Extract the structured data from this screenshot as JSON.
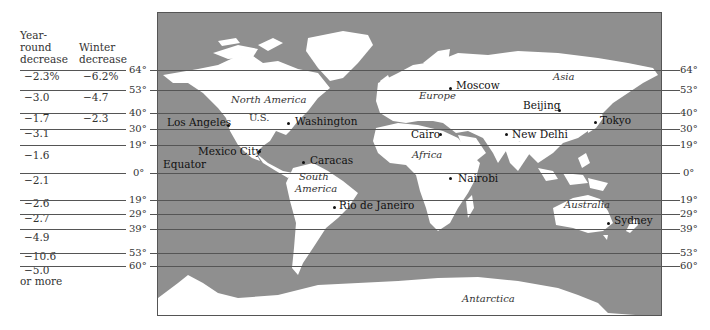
{
  "table": {
    "col1_header": [
      "Year-",
      "round",
      "decrease"
    ],
    "col2_header": [
      "Winter",
      "decrease"
    ],
    "rows": [
      {
        "year": "−2.3%",
        "winter": "−6.2%",
        "y": 76
      },
      {
        "year": "−3.0",
        "winter": "−4.7",
        "y": 97
      },
      {
        "year": "−1.7",
        "winter": "−2.3",
        "y": 118
      },
      {
        "year": "−3.1",
        "winter": "",
        "y": 133
      },
      {
        "year": "−1.6",
        "winter": "",
        "y": 155
      },
      {
        "year": "−2.1",
        "winter": "",
        "y": 180
      },
      {
        "year": "−2.6",
        "winter": "",
        "y": 203
      },
      {
        "year": "−2.7",
        "winter": "",
        "y": 218
      },
      {
        "year": "−4.9",
        "winter": "",
        "y": 237
      },
      {
        "year": "−10.6",
        "winter": "",
        "y": 256
      },
      {
        "year": "−5.0",
        "winter": "",
        "y": 270
      },
      {
        "year": "or more",
        "winter": "",
        "y": 281
      }
    ]
  },
  "latitudes": [
    {
      "label": "64°",
      "y": 70
    },
    {
      "label": "53°",
      "y": 90
    },
    {
      "label": "40°",
      "y": 113
    },
    {
      "label": "30°",
      "y": 129
    },
    {
      "label": "19°",
      "y": 145
    },
    {
      "label": "0°",
      "y": 173
    },
    {
      "label": "19°",
      "y": 200
    },
    {
      "label": "29°",
      "y": 214
    },
    {
      "label": "39°",
      "y": 229
    },
    {
      "label": "53°",
      "y": 253
    },
    {
      "label": "60°",
      "y": 266
    }
  ],
  "cities": [
    {
      "name": "Moscow",
      "dot": [
        449,
        87
      ],
      "label": [
        455,
        80
      ]
    },
    {
      "name": "Beijing",
      "dot": [
        558,
        109
      ],
      "label": [
        522,
        100
      ]
    },
    {
      "name": "Tokyo",
      "dot": [
        594,
        121
      ],
      "label": [
        599,
        115
      ]
    },
    {
      "name": "Los Angeles",
      "dot": [
        227,
        124
      ],
      "label": [
        166,
        117
      ]
    },
    {
      "name": "Washington",
      "dot": [
        287,
        122
      ],
      "label": [
        294,
        116
      ]
    },
    {
      "name": "Cairo",
      "dot": [
        439,
        133
      ],
      "label": [
        410,
        129
      ]
    },
    {
      "name": "New Delhi",
      "dot": [
        505,
        133
      ],
      "label": [
        511,
        129
      ]
    },
    {
      "name": "Mexico City",
      "dot": [
        258,
        150
      ],
      "label": [
        197,
        146
      ]
    },
    {
      "name": "Caracas",
      "dot": [
        302,
        161
      ],
      "label": [
        309,
        155
      ]
    },
    {
      "name": "Equator",
      "dot": null,
      "label": [
        162,
        159
      ]
    },
    {
      "name": "Nairobi",
      "dot": [
        449,
        177
      ],
      "label": [
        457,
        173
      ]
    },
    {
      "name": "Rio de Janeiro",
      "dot": [
        333,
        206
      ],
      "label": [
        338,
        200
      ]
    },
    {
      "name": "Sydney",
      "dot": [
        607,
        222
      ],
      "label": [
        613,
        215
      ]
    }
  ],
  "regions": [
    {
      "name": "North America",
      "pos": [
        230,
        99
      ]
    },
    {
      "name": "U.S.",
      "pos": [
        248,
        117
      ]
    },
    {
      "name": "Europe",
      "pos": [
        418,
        95
      ]
    },
    {
      "name": "Asia",
      "pos": [
        552,
        76
      ]
    },
    {
      "name": "Africa",
      "pos": [
        411,
        154
      ]
    },
    {
      "name": "South",
      "pos": [
        298,
        176
      ]
    },
    {
      "name": "America",
      "pos": [
        294,
        188
      ]
    },
    {
      "name": "Australia",
      "pos": [
        563,
        204
      ]
    },
    {
      "name": "Antarctica",
      "pos": [
        461,
        298
      ]
    }
  ],
  "colors": {
    "ocean": "#8f8f8f",
    "land": "#ffffff",
    "lines": "#555555"
  }
}
